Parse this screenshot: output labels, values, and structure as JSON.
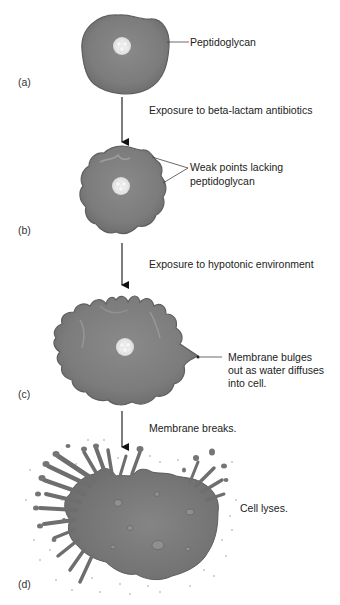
{
  "figure": {
    "panels": [
      {
        "id": "a",
        "label": "(a)",
        "callouts": [
          "Peptidoglycan"
        ],
        "transition_text": "Exposure to beta-lactam antibiotics"
      },
      {
        "id": "b",
        "label": "(b)",
        "callouts": [
          "Weak points lacking",
          "peptidoglycan"
        ],
        "transition_text": "Exposure to hypotonic environment"
      },
      {
        "id": "c",
        "label": "(c)",
        "callouts": [
          "Membrane bulges",
          "out as water diffuses",
          "into cell."
        ],
        "transition_text": "Membrane breaks."
      },
      {
        "id": "d",
        "label": "(d)",
        "callouts": [
          "Cell lyses."
        ]
      }
    ],
    "colors": {
      "cell_fill": "#7d7d7d",
      "cell_edge": "#5f5f5f",
      "cell_highlight": "#9a9a9a",
      "nucleoid": "#eeeeee",
      "arrow": "#111111",
      "leader_line": "#444444",
      "text": "#222222"
    }
  }
}
